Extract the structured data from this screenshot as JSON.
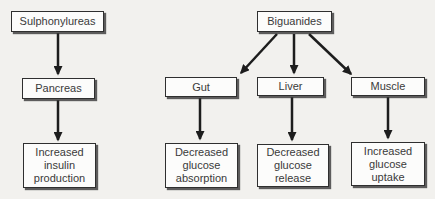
{
  "figure": {
    "background_color": "#f2f1ee",
    "box_fill_color": "#fcfcfb",
    "box_border_color": "#2f2f2f",
    "arrow_color": "#1d1d1d",
    "text_color": "#3a3a3a"
  },
  "left_pathway": {
    "drug": "Sulphonylureas",
    "target": "Pancreas",
    "effect": "Increased insulin production"
  },
  "right_pathway": {
    "drug": "Biguanides",
    "branches": [
      {
        "target": "Gut",
        "effect": "Decreased glucose absorption"
      },
      {
        "target": "Liver",
        "effect": "Decreased glucose release"
      },
      {
        "target": "Muscle",
        "effect": "Increased glucose uptake"
      }
    ]
  }
}
